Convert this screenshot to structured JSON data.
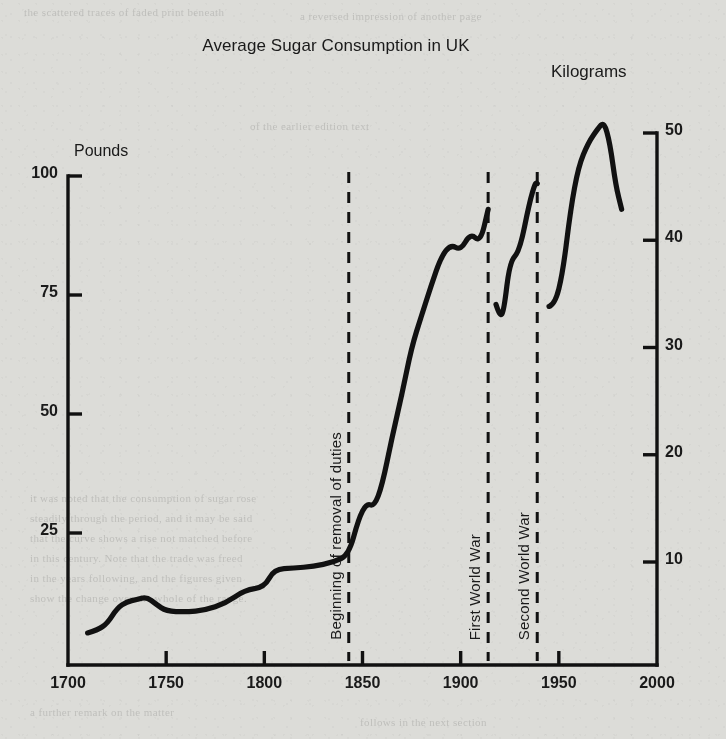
{
  "figure": {
    "title": "Average Sugar Consumption in UK",
    "left_axis_title": "Pounds",
    "right_axis_title": "Kilograms"
  },
  "ghost_text": [
    {
      "text": "the scattered traces of faded print beneath",
      "x": 24,
      "y": 6
    },
    {
      "text": "a reversed impression of another page",
      "x": 300,
      "y": 10
    },
    {
      "text": "of the earlier edition text",
      "x": 250,
      "y": 120
    },
    {
      "text": "it was noted that the consumption of sugar rose",
      "x": 30,
      "y": 492
    },
    {
      "text": "steadily through the period, and it may be said",
      "x": 30,
      "y": 512
    },
    {
      "text": "that the curve shows a rise not matched before",
      "x": 30,
      "y": 532
    },
    {
      "text": "in this century. Note that the trade was freed",
      "x": 30,
      "y": 552
    },
    {
      "text": "in the years following, and the figures given",
      "x": 30,
      "y": 572
    },
    {
      "text": "show the change over the whole of the range.",
      "x": 30,
      "y": 592
    },
    {
      "text": "a further remark on the matter",
      "x": 30,
      "y": 706
    },
    {
      "text": "follows in the next section",
      "x": 360,
      "y": 716
    }
  ],
  "chart_data": {
    "type": "line",
    "title": "Average Sugar Consumption in UK",
    "xlabel": "",
    "ylabel": "Pounds",
    "y2label": "Kilograms",
    "xlim": [
      1700,
      2000
    ],
    "ylim": [
      0,
      100
    ],
    "y2lim": [
      0,
      50
    ],
    "grid": false,
    "legend": "none",
    "xticks": [
      1700,
      1750,
      1800,
      1850,
      1900,
      1950,
      2000
    ],
    "xtick_labels": [
      "1700",
      "1750",
      "1800",
      "1850",
      "1900",
      "1950",
      "2000"
    ],
    "yticks": [
      25,
      50,
      75,
      100
    ],
    "ytick_labels": [
      "25",
      "50",
      "75",
      "100"
    ],
    "y2ticks": [
      10,
      20,
      30,
      40,
      50
    ],
    "y2tick_labels": [
      "10",
      "20",
      "30",
      "40",
      "50"
    ],
    "annotations": [
      {
        "label": "Beginning of removal of duties",
        "x": 1843,
        "style": "dashed-vline"
      },
      {
        "label": "First World War",
        "x": 1914,
        "style": "dashed-vline"
      },
      {
        "label": "Second World War",
        "x": 1939,
        "style": "dashed-vline"
      }
    ],
    "series": [
      {
        "name": "Average sugar consumption",
        "units": "pounds per head per year",
        "segments": [
          {
            "name": "1710-1914",
            "points": [
              [
                1710,
                4.0
              ],
              [
                1715,
                4.6
              ],
              [
                1720,
                6.0
              ],
              [
                1725,
                9.2
              ],
              [
                1730,
                10.6
              ],
              [
                1735,
                11.0
              ],
              [
                1740,
                11.6
              ],
              [
                1745,
                10.0
              ],
              [
                1750,
                8.6
              ],
              [
                1760,
                8.4
              ],
              [
                1770,
                8.8
              ],
              [
                1780,
                10.2
              ],
              [
                1790,
                13.0
              ],
              [
                1800,
                13.6
              ],
              [
                1805,
                17.4
              ],
              [
                1815,
                17.6
              ],
              [
                1825,
                18.0
              ],
              [
                1835,
                18.8
              ],
              [
                1843,
                20.4
              ],
              [
                1848,
                28.0
              ],
              [
                1852,
                31.2
              ],
              [
                1856,
                30.6
              ],
              [
                1860,
                35.0
              ],
              [
                1865,
                45.0
              ],
              [
                1870,
                54.0
              ],
              [
                1875,
                64.0
              ],
              [
                1880,
                70.6
              ],
              [
                1885,
                77.0
              ],
              [
                1890,
                83.0
              ],
              [
                1895,
                85.6
              ],
              [
                1900,
                84.4
              ],
              [
                1905,
                88.0
              ],
              [
                1910,
                86.0
              ],
              [
                1914,
                93.0
              ]
            ]
          },
          {
            "name": "1918-1939",
            "points": [
              [
                1918,
                73.0
              ],
              [
                1920,
                70.4
              ],
              [
                1922,
                71.6
              ],
              [
                1925,
                82.0
              ],
              [
                1930,
                84.2
              ],
              [
                1935,
                94.4
              ],
              [
                1938,
                98.6
              ],
              [
                1939,
                98.4
              ]
            ]
          },
          {
            "name": "1945-1983",
            "points": [
              [
                1945,
                72.6
              ],
              [
                1948,
                73.0
              ],
              [
                1952,
                79.6
              ],
              [
                1956,
                93.0
              ],
              [
                1960,
                102.0
              ],
              [
                1965,
                107.0
              ],
              [
                1970,
                110.0
              ],
              [
                1973,
                111.4
              ],
              [
                1976,
                107.0
              ],
              [
                1979,
                98.0
              ],
              [
                1982,
                93.0
              ]
            ]
          }
        ]
      }
    ]
  }
}
